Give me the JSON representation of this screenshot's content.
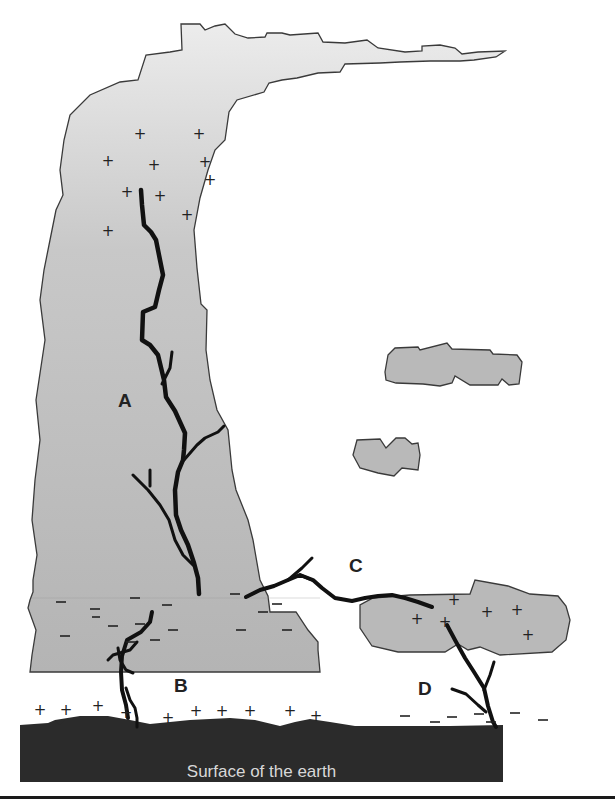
{
  "diagram": {
    "labels": {
      "A": "A",
      "B": "B",
      "C": "C",
      "D": "D",
      "ground": "Surface of the earth"
    },
    "colors": {
      "cloud_fill": "#b9b9b9",
      "cloud_fill_light": "#e4e4e4",
      "cloud_outline": "#3a3a3a",
      "ground_fill": "#2b2b2b",
      "lightning": "#111111",
      "label_text": "#222222",
      "ground_text": "#d8d8d8"
    },
    "charges": {
      "cloud_top_positive": 11,
      "cloud_base_negative": 16,
      "ground_positive_under_B": 13,
      "small_cloud_positive": 6,
      "ground_negative_under_D": 7
    },
    "discharge_types": [
      {
        "id": "A",
        "location": "within the thundercloud"
      },
      {
        "id": "B",
        "location": "cloud to ground (negative cloud base to positive ground)"
      },
      {
        "id": "C",
        "location": "cloud to cloud"
      },
      {
        "id": "D",
        "location": "positive cloud to negative ground"
      }
    ]
  }
}
